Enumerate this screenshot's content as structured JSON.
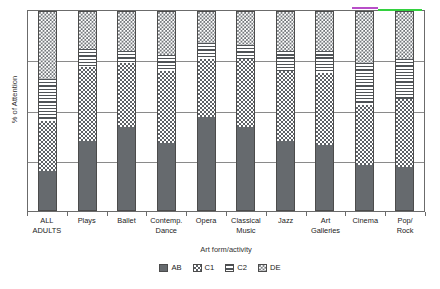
{
  "chart_data": {
    "type": "bar",
    "subtype": "stacked-bar-100-percent",
    "title": "",
    "xlabel": "Art form/activity",
    "ylabel": "% of Attention",
    "ylim": [
      0,
      100
    ],
    "grid": true,
    "gridlines": [
      0,
      25,
      50,
      75,
      100
    ],
    "ytick_labels": [],
    "legend_position": "bottom",
    "categories": [
      "ALL ADULTS",
      "Plays",
      "Ballet",
      "Contemp. Dance",
      "Opera",
      "Classical Music",
      "Jazz",
      "Art Galleries",
      "Cinema",
      "Pop/ Rock"
    ],
    "category_lines": [
      [
        "ALL",
        "ADULTS"
      ],
      [
        "Plays"
      ],
      [
        "Ballet"
      ],
      [
        "Contemp.",
        "Dance"
      ],
      [
        "Opera"
      ],
      [
        "Classical",
        "Music"
      ],
      [
        "Jazz"
      ],
      [
        "Art",
        "Galleries"
      ],
      [
        "Cinema"
      ],
      [
        "Pop/",
        "Rock"
      ]
    ],
    "series": [
      {
        "name": "AB",
        "pattern": "solid-dark-grey",
        "values": [
          20,
          35,
          42,
          34,
          47,
          42,
          35,
          33,
          23,
          22
        ]
      },
      {
        "name": "C1",
        "pattern": "checkerboard",
        "values": [
          25,
          37,
          32,
          36,
          29,
          34,
          35,
          36,
          30,
          34
        ]
      },
      {
        "name": "C2",
        "pattern": "horizontal-lines",
        "values": [
          21,
          9,
          6,
          8,
          8,
          7,
          10,
          11,
          21,
          20
        ]
      },
      {
        "name": "DE",
        "pattern": "fine-dots",
        "values": [
          34,
          19,
          20,
          22,
          16,
          17,
          20,
          20,
          26,
          24
        ]
      }
    ],
    "legend_entries": [
      {
        "label": "AB",
        "pattern": "solid-dark-grey"
      },
      {
        "label": "C1",
        "pattern": "checkerboard"
      },
      {
        "label": "C2",
        "pattern": "horizontal-lines"
      },
      {
        "label": "DE",
        "pattern": "fine-dots"
      }
    ],
    "colors": {
      "AB": "#666a6e",
      "pattern_ink": "#4f5357",
      "axis": "#6b6b6b",
      "grid": "#8a8a8a",
      "background": "#ffffff"
    }
  },
  "artifacts": [
    {
      "name": "magenta-streak",
      "color": "#b84ec8",
      "left": 352,
      "top": 7,
      "width": 26
    },
    {
      "name": "green-streak",
      "color": "#33d13f",
      "left": 378,
      "top": 9,
      "width": 44
    }
  ]
}
